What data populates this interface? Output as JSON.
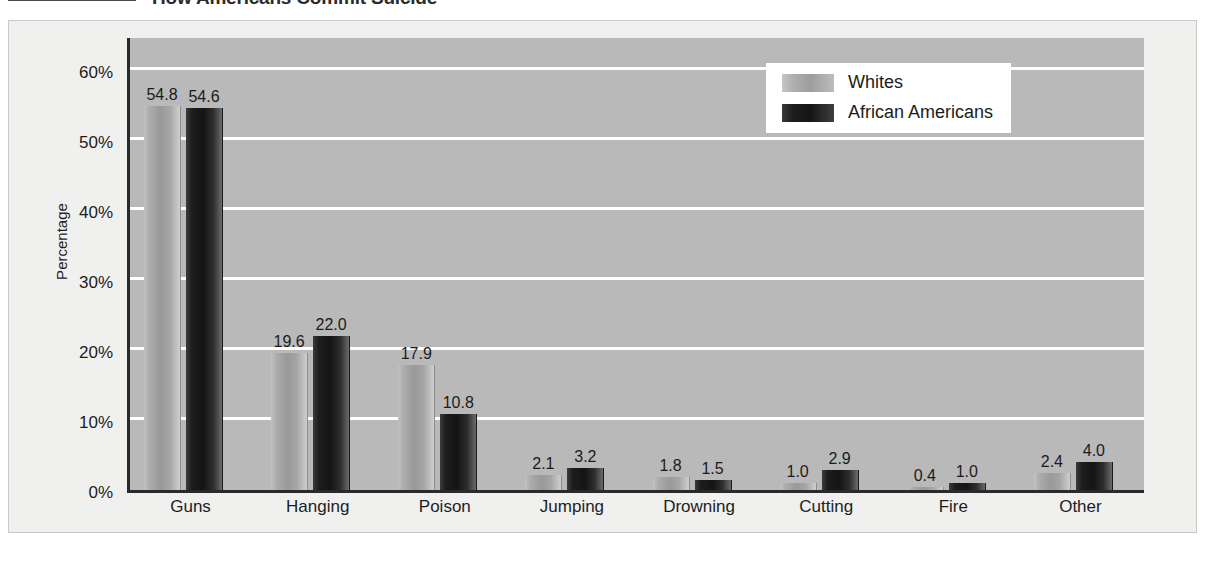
{
  "title": {
    "text": "How Americans Commit Suicide",
    "rule_color": "#4a4a4a"
  },
  "colors": {
    "plot_background": "#b9b9b9",
    "figure_background": "#f0f0ef",
    "gridline": "#ffffff",
    "axis": "#2a2a2a",
    "whites_series": "#9d9d9d",
    "african_americans_series": "#151515"
  },
  "legend": {
    "position": "top-right",
    "entries": [
      {
        "label": "Whites",
        "swatch": "whites"
      },
      {
        "label": "African Americans",
        "swatch": "aa"
      }
    ]
  },
  "chart_data": {
    "type": "bar",
    "title": "How Americans Commit Suicide",
    "xlabel": "",
    "ylabel": "Percentage",
    "ylim": [
      0,
      65
    ],
    "yticks": [
      0,
      10,
      20,
      30,
      40,
      50,
      60
    ],
    "ytick_labels": [
      "0%",
      "10%",
      "20%",
      "30%",
      "40%",
      "50%",
      "60%"
    ],
    "grid": true,
    "legend_position": "top-right",
    "categories": [
      "Guns",
      "Hanging",
      "Poison",
      "Jumping",
      "Drowning",
      "Cutting",
      "Fire",
      "Other"
    ],
    "series": [
      {
        "name": "Whites",
        "values": [
          54.8,
          19.6,
          17.9,
          2.1,
          1.8,
          1.0,
          0.4,
          2.4
        ],
        "labels": [
          "54.8",
          "19.6",
          "17.9",
          "2.1",
          "1.8",
          "1.0",
          "0.4",
          "2.4"
        ]
      },
      {
        "name": "African Americans",
        "values": [
          54.6,
          22.0,
          10.8,
          3.2,
          1.5,
          2.9,
          1.0,
          4.0
        ],
        "labels": [
          "54.6",
          "22.0",
          "10.8",
          "3.2",
          "1.5",
          "2.9",
          "1.0",
          "4.0"
        ]
      }
    ]
  }
}
